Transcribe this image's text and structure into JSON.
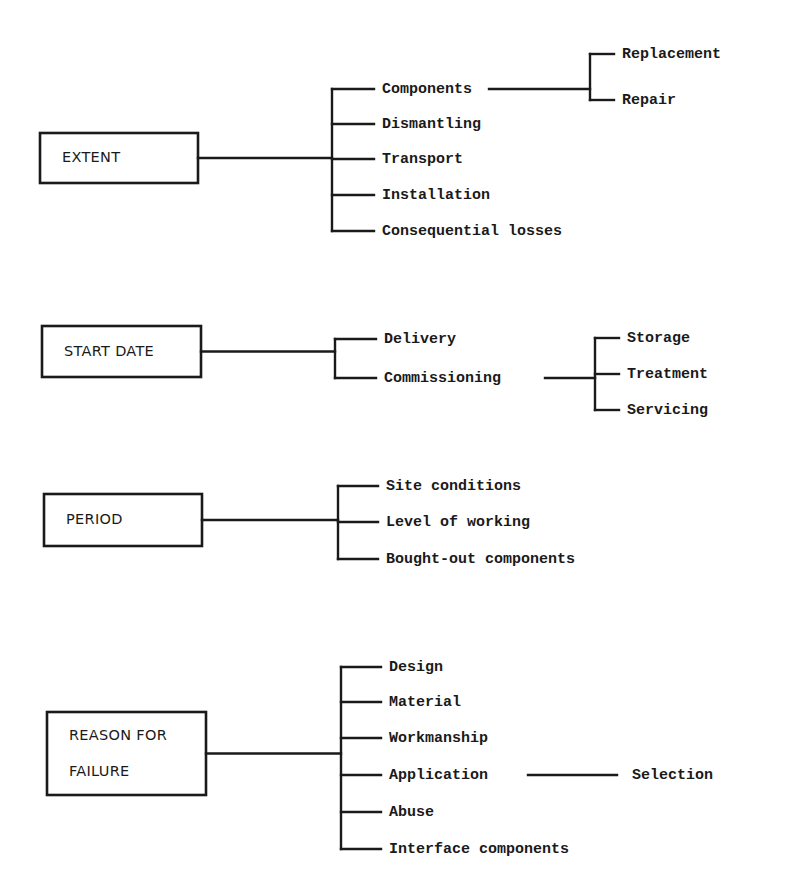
{
  "diagram": {
    "type": "tree",
    "colors": {
      "ink": "#1a1a1a",
      "background": "#ffffff"
    },
    "groups": [
      {
        "id": "extent",
        "label_lines": [
          "EXTENT"
        ],
        "children": [
          {
            "label": "Components",
            "children": [
              "Replacement",
              "Repair"
            ]
          },
          {
            "label": "Dismantling"
          },
          {
            "label": "Transport"
          },
          {
            "label": "Installation"
          },
          {
            "label": "Consequential losses"
          }
        ]
      },
      {
        "id": "start-date",
        "label_lines": [
          "START DATE"
        ],
        "children": [
          {
            "label": "Delivery"
          },
          {
            "label": "Commissioning",
            "children": [
              "Storage",
              "Treatment",
              "Servicing"
            ]
          }
        ]
      },
      {
        "id": "period",
        "label_lines": [
          "PERIOD"
        ],
        "children": [
          {
            "label": "Site conditions"
          },
          {
            "label": "Level of working"
          },
          {
            "label": "Bought-out components"
          }
        ]
      },
      {
        "id": "reason-for-failure",
        "label_lines": [
          "REASON FOR",
          "FAILURE"
        ],
        "children": [
          {
            "label": "Design"
          },
          {
            "label": "Material"
          },
          {
            "label": "Workmanship"
          },
          {
            "label": "Application",
            "children": [
              "Selection"
            ]
          },
          {
            "label": "Abuse"
          },
          {
            "label": "Interface components"
          }
        ]
      }
    ]
  }
}
